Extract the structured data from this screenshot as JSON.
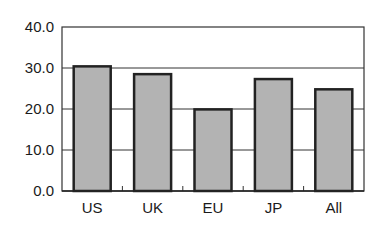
{
  "chart_data": {
    "type": "bar",
    "title": "",
    "xlabel": "",
    "ylabel": "",
    "categories": [
      "US",
      "UK",
      "EU",
      "JP",
      "All"
    ],
    "values": [
      30.4,
      28.5,
      19.9,
      27.3,
      24.8
    ],
    "ylim": [
      0,
      40
    ],
    "yticks": [
      "0.0",
      "10.0",
      "20.0",
      "30.0",
      "40.0"
    ],
    "grid": true,
    "legend": null,
    "colors": {
      "bar_fill": "#b3b3b3",
      "bar_edge": "#222222",
      "grid": "#333333"
    }
  }
}
